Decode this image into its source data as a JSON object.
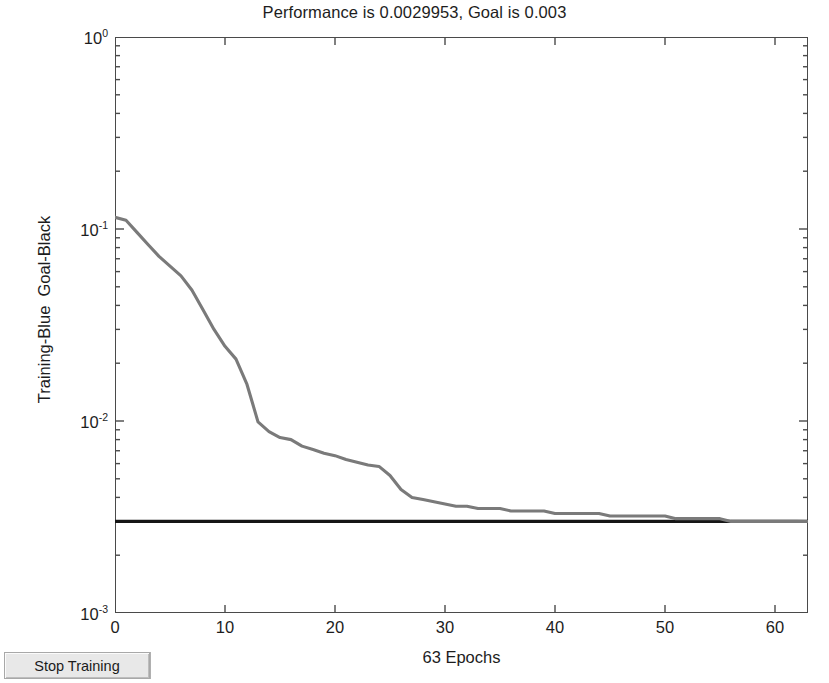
{
  "window": {
    "stop_button_label": "Stop Training"
  },
  "chart_data": {
    "type": "line",
    "title": "Performance is 0.0029953, Goal is 0.003",
    "xlabel": "63 Epochs",
    "ylabel": "Training-Blue  Goal-Black",
    "yscale": "log",
    "xlim": [
      0,
      63
    ],
    "ylim": [
      0.001,
      1
    ],
    "grid": false,
    "legend": "none",
    "xticks": [
      0,
      10,
      20,
      30,
      40,
      50,
      60
    ],
    "xticklabels": [
      "0",
      "10",
      "20",
      "30",
      "40",
      "50",
      "60"
    ],
    "yticks": [
      1,
      0.1,
      0.01,
      0.001
    ],
    "yticklabels": [
      "10",
      "10",
      "10",
      "10"
    ],
    "ytickexponents": [
      "0",
      "-1",
      "-2",
      "-3"
    ],
    "performance": 0.0029953,
    "goal": 0.003,
    "epochs": 63,
    "series": [
      {
        "name": "Training-Blue",
        "color": "#7a7a7a",
        "x": [
          0,
          1,
          2,
          3,
          4,
          5,
          6,
          7,
          8,
          9,
          10,
          11,
          12,
          13,
          14,
          15,
          16,
          17,
          18,
          19,
          20,
          21,
          22,
          23,
          24,
          25,
          26,
          27,
          28,
          29,
          30,
          31,
          32,
          33,
          34,
          35,
          36,
          37,
          38,
          39,
          40,
          41,
          42,
          43,
          44,
          45,
          46,
          47,
          48,
          49,
          50,
          51,
          52,
          53,
          54,
          55,
          56,
          57,
          58,
          59,
          60,
          61,
          62,
          63
        ],
        "values": [
          0.115,
          0.111,
          0.096,
          0.083,
          0.072,
          0.064,
          0.057,
          0.048,
          0.038,
          0.03,
          0.0245,
          0.021,
          0.0155,
          0.0099,
          0.0088,
          0.0082,
          0.008,
          0.0074,
          0.0071,
          0.0068,
          0.0066,
          0.0063,
          0.0061,
          0.0059,
          0.0058,
          0.0052,
          0.0044,
          0.004,
          0.0039,
          0.0038,
          0.0037,
          0.0036,
          0.0036,
          0.0035,
          0.0035,
          0.0035,
          0.0034,
          0.0034,
          0.0034,
          0.0034,
          0.0033,
          0.0033,
          0.0033,
          0.0033,
          0.0033,
          0.0032,
          0.0032,
          0.0032,
          0.0032,
          0.0032,
          0.0032,
          0.0031,
          0.0031,
          0.0031,
          0.0031,
          0.0031,
          0.003,
          0.003,
          0.003,
          0.003,
          0.003,
          0.003,
          0.003,
          0.0029953
        ]
      },
      {
        "name": "Goal-Black",
        "color": "#161616",
        "x": [
          0,
          63
        ],
        "values": [
          0.003,
          0.003
        ]
      }
    ]
  }
}
